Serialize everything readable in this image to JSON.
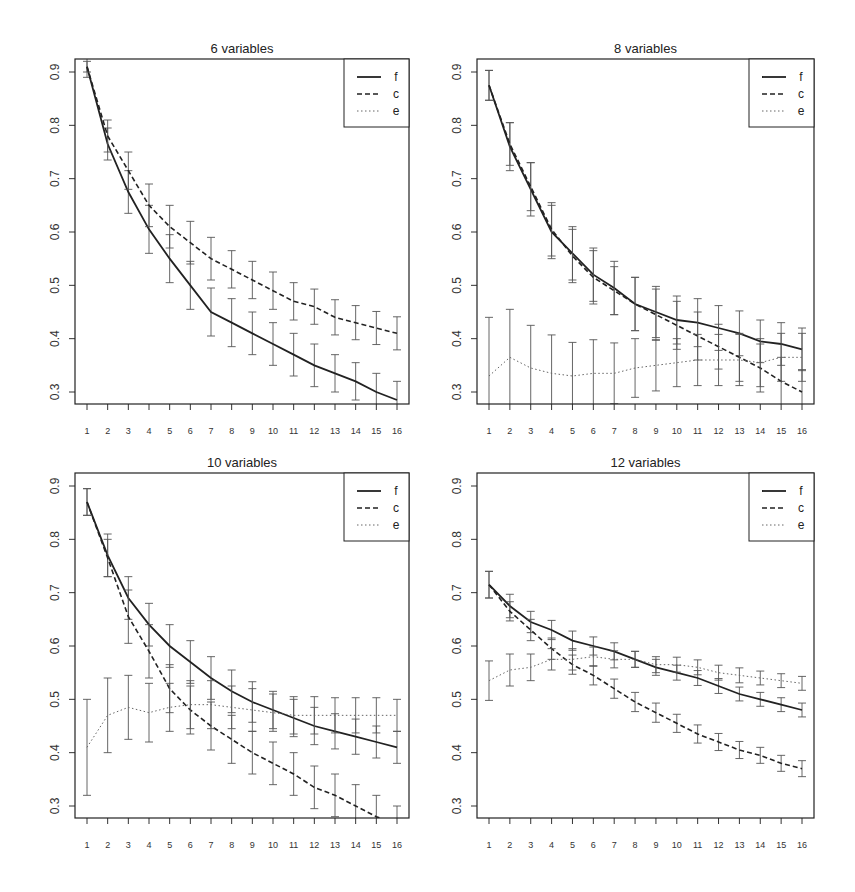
{
  "figure": {
    "panel_titles": [
      "6 variables",
      "8 variables",
      "10 variables",
      "12 variables"
    ],
    "legend": [
      "f",
      "c",
      "e"
    ]
  },
  "chart_data": [
    {
      "type": "line",
      "title": "6 variables",
      "xlabel": "",
      "ylabel": "",
      "x": [
        1,
        2,
        3,
        4,
        5,
        6,
        7,
        8,
        9,
        10,
        11,
        12,
        13,
        14,
        15,
        16
      ],
      "yticks": [
        0.3,
        0.4,
        0.5,
        0.6,
        0.7,
        0.8,
        0.9
      ],
      "ylim": [
        0.275,
        0.925
      ],
      "legend": [
        "f",
        "c",
        "e"
      ],
      "legend_position": "topright",
      "series": [
        {
          "name": "f",
          "style": "solid",
          "values": [
            0.91,
            0.765,
            0.675,
            0.605,
            0.55,
            0.5,
            0.45,
            0.43,
            0.41,
            0.39,
            0.37,
            0.35,
            0.335,
            0.32,
            0.3,
            0.285
          ],
          "err": [
            0.02,
            0.03,
            0.04,
            0.045,
            0.045,
            0.045,
            0.045,
            0.045,
            0.04,
            0.04,
            0.04,
            0.04,
            0.035,
            0.035,
            0.035,
            0.035
          ]
        },
        {
          "name": "c",
          "style": "dashed",
          "values": [
            0.91,
            0.78,
            0.715,
            0.65,
            0.61,
            0.58,
            0.55,
            0.53,
            0.51,
            0.49,
            0.47,
            0.46,
            0.44,
            0.43,
            0.42,
            0.41
          ],
          "err": [
            0.01,
            0.03,
            0.035,
            0.04,
            0.04,
            0.04,
            0.04,
            0.035,
            0.035,
            0.035,
            0.035,
            0.033,
            0.033,
            0.032,
            0.031,
            0.031
          ]
        }
      ]
    },
    {
      "type": "line",
      "title": "8 variables",
      "xlabel": "",
      "ylabel": "",
      "x": [
        1,
        2,
        3,
        4,
        5,
        6,
        7,
        8,
        9,
        10,
        11,
        12,
        13,
        14,
        15,
        16
      ],
      "yticks": [
        0.3,
        0.4,
        0.5,
        0.6,
        0.7,
        0.8,
        0.9
      ],
      "ylim": [
        0.275,
        0.925
      ],
      "legend": [
        "f",
        "c",
        "e"
      ],
      "legend_position": "topright",
      "series": [
        {
          "name": "f",
          "style": "solid",
          "values": [
            0.875,
            0.76,
            0.68,
            0.6,
            0.56,
            0.52,
            0.495,
            0.465,
            0.45,
            0.435,
            0.43,
            0.42,
            0.41,
            0.395,
            0.39,
            0.38
          ],
          "err": [
            0.028,
            0.045,
            0.05,
            0.05,
            0.05,
            0.05,
            0.05,
            0.05,
            0.048,
            0.045,
            0.045,
            0.042,
            0.042,
            0.04,
            0.04,
            0.04
          ]
        },
        {
          "name": "c",
          "style": "dashed",
          "values": [
            0.875,
            0.765,
            0.685,
            0.605,
            0.555,
            0.515,
            0.49,
            0.465,
            0.445,
            0.425,
            0.405,
            0.385,
            0.365,
            0.345,
            0.32,
            0.3
          ],
          "err": [
            0.028,
            0.04,
            0.045,
            0.05,
            0.05,
            0.05,
            0.045,
            0.05,
            0.048,
            0.045,
            0.045,
            0.042,
            0.045,
            0.045,
            0.045,
            0.042
          ]
        },
        {
          "name": "e",
          "style": "dotted",
          "values": [
            0.33,
            0.365,
            0.345,
            0.335,
            0.33,
            0.335,
            0.335,
            0.345,
            0.35,
            0.355,
            0.36,
            0.36,
            0.36,
            0.355,
            0.365,
            0.365
          ],
          "err": [
            0.11,
            0.09,
            0.08,
            0.072,
            0.063,
            0.063,
            0.057,
            0.055,
            0.048,
            0.045,
            0.048,
            0.048,
            0.048,
            0.045,
            0.045,
            0.045
          ]
        }
      ]
    },
    {
      "type": "line",
      "title": "10 variables",
      "xlabel": "",
      "ylabel": "",
      "x": [
        1,
        2,
        3,
        4,
        5,
        6,
        7,
        8,
        9,
        10,
        11,
        12,
        13,
        14,
        15,
        16
      ],
      "yticks": [
        0.3,
        0.4,
        0.5,
        0.6,
        0.7,
        0.8,
        0.9
      ],
      "ylim": [
        0.275,
        0.925
      ],
      "legend": [
        "f",
        "c",
        "e"
      ],
      "legend_position": "topright",
      "series": [
        {
          "name": "f",
          "style": "solid",
          "values": [
            0.87,
            0.77,
            0.69,
            0.64,
            0.6,
            0.57,
            0.54,
            0.515,
            0.495,
            0.48,
            0.465,
            0.45,
            0.44,
            0.43,
            0.42,
            0.41
          ],
          "err": [
            0.025,
            0.04,
            0.04,
            0.04,
            0.04,
            0.04,
            0.04,
            0.04,
            0.038,
            0.035,
            0.035,
            0.035,
            0.033,
            0.033,
            0.03,
            0.03
          ]
        },
        {
          "name": "c",
          "style": "dashed",
          "values": [
            0.87,
            0.765,
            0.655,
            0.59,
            0.52,
            0.48,
            0.45,
            0.425,
            0.4,
            0.38,
            0.36,
            0.335,
            0.32,
            0.3,
            0.28,
            0.265
          ],
          "err": [
            0.025,
            0.035,
            0.05,
            0.05,
            0.045,
            0.045,
            0.045,
            0.045,
            0.04,
            0.04,
            0.04,
            0.04,
            0.04,
            0.04,
            0.04,
            0.035
          ]
        },
        {
          "name": "e",
          "style": "dotted",
          "values": [
            0.41,
            0.47,
            0.485,
            0.475,
            0.485,
            0.49,
            0.49,
            0.485,
            0.48,
            0.475,
            0.47,
            0.47,
            0.47,
            0.47,
            0.47,
            0.47
          ],
          "err": [
            0.09,
            0.07,
            0.06,
            0.055,
            0.045,
            0.045,
            0.045,
            0.04,
            0.04,
            0.035,
            0.035,
            0.035,
            0.033,
            0.033,
            0.033,
            0.03
          ]
        }
      ]
    },
    {
      "type": "line",
      "title": "12 variables",
      "xlabel": "",
      "ylabel": "",
      "x": [
        1,
        2,
        3,
        4,
        5,
        6,
        7,
        8,
        9,
        10,
        11,
        12,
        13,
        14,
        15,
        16
      ],
      "yticks": [
        0.3,
        0.4,
        0.5,
        0.6,
        0.7,
        0.8,
        0.9
      ],
      "ylim": [
        0.275,
        0.925
      ],
      "legend": [
        "f",
        "c",
        "e"
      ],
      "legend_position": "topright",
      "series": [
        {
          "name": "f",
          "style": "solid",
          "values": [
            0.715,
            0.675,
            0.645,
            0.63,
            0.61,
            0.6,
            0.59,
            0.575,
            0.56,
            0.55,
            0.54,
            0.525,
            0.51,
            0.5,
            0.49,
            0.48
          ],
          "err": [
            0.025,
            0.022,
            0.02,
            0.018,
            0.018,
            0.017,
            0.016,
            0.015,
            0.015,
            0.014,
            0.014,
            0.014,
            0.013,
            0.013,
            0.013,
            0.013
          ]
        },
        {
          "name": "c",
          "style": "dashed",
          "values": [
            0.715,
            0.665,
            0.63,
            0.595,
            0.565,
            0.545,
            0.52,
            0.495,
            0.475,
            0.455,
            0.435,
            0.42,
            0.405,
            0.395,
            0.38,
            0.37
          ],
          "err": [
            0.025,
            0.018,
            0.02,
            0.02,
            0.018,
            0.018,
            0.018,
            0.018,
            0.018,
            0.017,
            0.017,
            0.016,
            0.016,
            0.015,
            0.015,
            0.015
          ]
        },
        {
          "name": "e",
          "style": "dotted",
          "values": [
            0.535,
            0.555,
            0.56,
            0.575,
            0.575,
            0.58,
            0.575,
            0.575,
            0.565,
            0.565,
            0.56,
            0.55,
            0.545,
            0.54,
            0.535,
            0.53
          ],
          "err": [
            0.037,
            0.03,
            0.025,
            0.02,
            0.02,
            0.018,
            0.016,
            0.015,
            0.015,
            0.014,
            0.014,
            0.014,
            0.014,
            0.013,
            0.013,
            0.013
          ]
        }
      ]
    }
  ]
}
